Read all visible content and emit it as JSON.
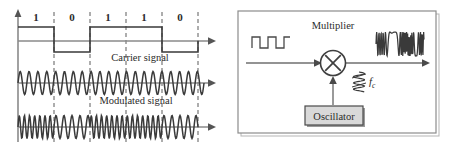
{
  "figure": {
    "colors": {
      "stroke_dark": "#333333",
      "stroke_mid": "#6f6f6f",
      "stroke_light": "#8a8a8a",
      "dashed": "#6b6b6b",
      "panel_border": "#8c8c8c",
      "box_fill": "#d9d9d9",
      "box_stroke": "#4a4a4a",
      "shadow": "#9a9a9a",
      "background": "#ffffff",
      "text": "#2b2b2b"
    }
  },
  "left_panel": {
    "name": "waveform-plot",
    "bit_sequence": [
      "1",
      "0",
      "1",
      "1",
      "0"
    ],
    "labels": {
      "carrier": "Carrier signal",
      "modulated": "Modulated signal"
    },
    "traces": [
      {
        "name": "binary-data-signal",
        "type": "square"
      },
      {
        "name": "carrier-signal",
        "type": "sine"
      },
      {
        "name": "modulated-signal",
        "type": "fsk"
      }
    ]
  },
  "right_panel": {
    "name": "block-diagram",
    "multiplier_label": "Multiplier",
    "oscillator_label": "Oscillator",
    "carrier_freq_label": "f",
    "carrier_freq_sub": "c",
    "input_waveform": "digital-square-wave",
    "output_waveform": "fsk-modulated-wave",
    "multiplier_symbol": "×"
  }
}
